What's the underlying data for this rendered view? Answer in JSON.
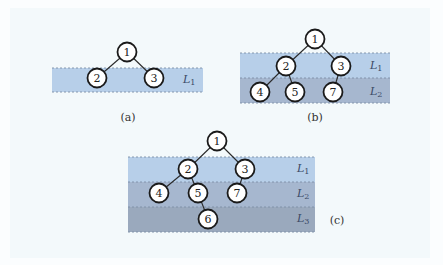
{
  "colors": {
    "background": "#fbfdfe",
    "panel": "#f3f9fb",
    "band_L1": "#b7cfe9",
    "band_L2": "#a6b7cf",
    "band_L3": "#9aa9bd",
    "node_fill": "#ffffff",
    "node_stroke": "#1a1a1a"
  },
  "subfigures": [
    {
      "caption": "(a)",
      "levels": [
        {
          "name": "L",
          "sub": "1"
        }
      ],
      "nodes": [
        "1",
        "2",
        "3"
      ],
      "edges": [
        [
          "1",
          "2"
        ],
        [
          "1",
          "3"
        ]
      ]
    },
    {
      "caption": "(b)",
      "levels": [
        {
          "name": "L",
          "sub": "1"
        },
        {
          "name": "L",
          "sub": "2"
        }
      ],
      "nodes": [
        "1",
        "2",
        "3",
        "4",
        "5",
        "7"
      ],
      "edges": [
        [
          "1",
          "2"
        ],
        [
          "1",
          "3"
        ],
        [
          "2",
          "4"
        ],
        [
          "2",
          "5"
        ],
        [
          "3",
          "7"
        ]
      ]
    },
    {
      "caption": "(c)",
      "levels": [
        {
          "name": "L",
          "sub": "1"
        },
        {
          "name": "L",
          "sub": "2"
        },
        {
          "name": "L",
          "sub": "3"
        }
      ],
      "nodes": [
        "1",
        "2",
        "3",
        "4",
        "5",
        "7",
        "6"
      ],
      "edges": [
        [
          "1",
          "2"
        ],
        [
          "1",
          "3"
        ],
        [
          "2",
          "4"
        ],
        [
          "2",
          "5"
        ],
        [
          "3",
          "7"
        ],
        [
          "5",
          "6"
        ]
      ]
    }
  ]
}
